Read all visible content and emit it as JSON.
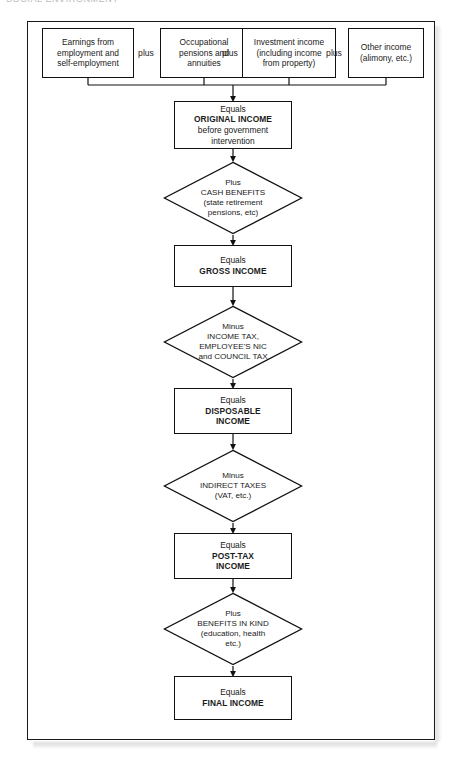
{
  "page": {
    "running_header": "SOCIAL ENVIRONMENT"
  },
  "diagram": {
    "connectors": {
      "plus_label_1": "plus",
      "plus_label_2": "plus",
      "plus_label_3": "plus"
    },
    "sources": [
      {
        "name": "earnings",
        "line1": "Earnings from",
        "line2": "employment and",
        "line3": "self-employment"
      },
      {
        "name": "occupational-pensions",
        "line1": "Occupational",
        "line2": "pensions and",
        "line3": "annuities"
      },
      {
        "name": "investment-income",
        "line1": "Investment income",
        "line2": "(including income",
        "line3": "from property)"
      },
      {
        "name": "other-income",
        "line1": "Other income",
        "line2": "(alimony, etc.)",
        "line3": ""
      }
    ],
    "stages": [
      {
        "name": "original-income",
        "lead": "Equals",
        "key": "ORIGINAL INCOME",
        "sub1": "before government",
        "sub2": "intervention"
      },
      {
        "name": "gross-income",
        "lead": "Equals",
        "key": "GROSS INCOME",
        "sub1": "",
        "sub2": ""
      },
      {
        "name": "disposable-income",
        "lead": "Equals",
        "key": "DISPOSABLE",
        "key2": "INCOME",
        "sub1": "",
        "sub2": ""
      },
      {
        "name": "post-tax-income",
        "lead": "Equals",
        "key": "POST-TAX",
        "key2": "INCOME",
        "sub1": "",
        "sub2": ""
      },
      {
        "name": "final-income",
        "lead": "Equals",
        "key": "FINAL INCOME",
        "sub1": "",
        "sub2": ""
      }
    ],
    "operations": [
      {
        "name": "cash-benefits",
        "op": "Plus",
        "line1": "CASH BENEFITS",
        "line2": "(state retirement",
        "line3": "pensions, etc)"
      },
      {
        "name": "direct-taxes",
        "op": "Minus",
        "line1": "INCOME TAX,",
        "line2": "EMPLOYEE'S NIC",
        "line3": "and COUNCIL TAX"
      },
      {
        "name": "indirect-taxes",
        "op": "Minus",
        "line1": "INDIRECT TAXES",
        "line2": "(VAT, etc.)",
        "line3": ""
      },
      {
        "name": "benefits-in-kind",
        "op": "Plus",
        "line1": "BENEFITS IN KIND",
        "line2": "(education, health",
        "line3": "etc.)"
      }
    ]
  },
  "colors": {
    "line": "#111111",
    "frame": "#1a1a1a",
    "text": "#1a1a1a",
    "background": "#ffffff"
  }
}
